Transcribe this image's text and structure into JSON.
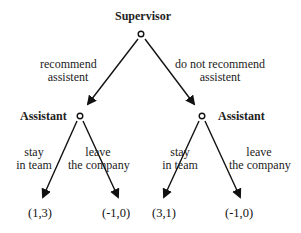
{
  "diagram": {
    "type": "game-tree",
    "root": {
      "player": "Supervisor",
      "actions": [
        {
          "label_line1": "recommend",
          "label_line2": "assistent"
        },
        {
          "label_line1": "do not recommend",
          "label_line2": "assistent"
        }
      ]
    },
    "children": [
      {
        "player": "Assistant",
        "actions": [
          {
            "label_line1": "stay",
            "label_line2": "in team",
            "payoff": "(1,3)"
          },
          {
            "label_line1": "leave",
            "label_line2": "the company",
            "payoff": "(-1,0)"
          }
        ]
      },
      {
        "player": "Assistant",
        "actions": [
          {
            "label_line1": "stay",
            "label_line2": "in team",
            "payoff": "(3,1)"
          },
          {
            "label_line1": "leave",
            "label_line2": "the company",
            "payoff": "(-1,0)"
          }
        ]
      }
    ]
  }
}
